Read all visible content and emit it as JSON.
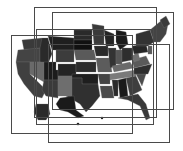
{
  "map": {
    "title": "",
    "type": "choropleth",
    "region": "United States",
    "palette": [
      "#1a1a1a",
      "#2e2e2e",
      "#3c3c3c",
      "#505050",
      "#666666",
      "#7a7a7a"
    ],
    "background": "#ffffff",
    "frame_color": "#4a4a4a"
  },
  "frames": [
    {
      "x": 34,
      "y": 7,
      "w": 123,
      "h": 111
    },
    {
      "x": 52,
      "y": 12,
      "w": 122,
      "h": 98
    },
    {
      "x": 36,
      "y": 29,
      "w": 118,
      "h": 96
    },
    {
      "x": 11,
      "y": 35,
      "w": 122,
      "h": 99
    },
    {
      "x": 48,
      "y": 44,
      "w": 122,
      "h": 99
    }
  ]
}
